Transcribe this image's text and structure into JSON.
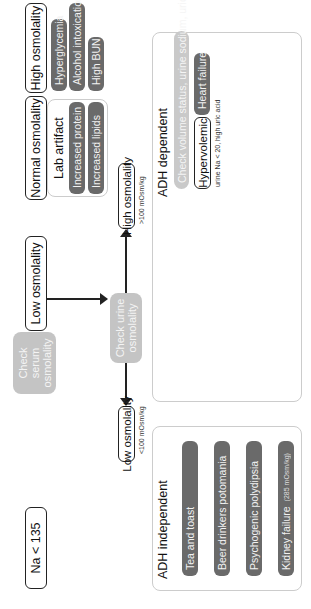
{
  "start": {
    "label": "Na < 135"
  },
  "check_serum": {
    "label": "Check serum osmolality"
  },
  "serum_branches": {
    "low": {
      "label": "Low osmolality"
    },
    "normal": {
      "label": "Normal osmolality",
      "panel_title": "Lab artifact",
      "items": [
        "Increased protein",
        "Increased lipids"
      ]
    },
    "high": {
      "label": "High osmolality",
      "items": [
        "Hyperglycemia",
        "Alcohol intoxication",
        "High BUN"
      ]
    }
  },
  "check_urine": {
    "label": "Check urine osmolality"
  },
  "urine_branches": {
    "low": {
      "label": "Low osmolality",
      "threshold": "<100 mOsm/kg"
    },
    "high": {
      "label": "High osmolality",
      "threshold": ">100 mOsm/kg"
    }
  },
  "adh_independent": {
    "title": "ADH independent",
    "items": [
      "Tea and toast",
      "Beer drinkers potomania",
      "Psychogenic polydipsia",
      "Kidney failure"
    ],
    "kidney_note": "(285 mOsm/kg)"
  },
  "adh_dependent": {
    "title": "ADH dependent",
    "check": "Check volume status, urine sodium, uric acid",
    "groups": [
      {
        "label": "Hypervolemic",
        "note": "urine Na < 20, high uric acid",
        "items": [
          "Heart failure",
          "Liver failure",
          "Nephrotic syndrome"
        ]
      },
      {
        "label": "Hypovolemic",
        "note": "urine Na < 20, high uric acid",
        "items": [
          "GI losses",
          "Kidney losses",
          "Other losses"
        ]
      },
      {
        "label": "Euvolemic",
        "note": "urine Na > 20, low uric acid",
        "items": [
          "Hypothyroidism",
          "Adrenal insufficiency",
          "SIADH"
        ]
      }
    ]
  },
  "colors": {
    "pill": "#6a6a6a",
    "check": "#c4c4c4",
    "border": "#222222"
  }
}
